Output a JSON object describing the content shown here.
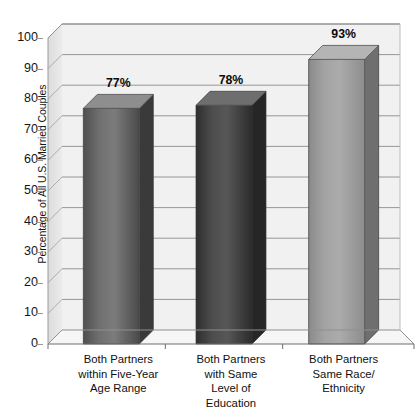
{
  "chart_data": {
    "type": "bar",
    "title": "",
    "subtitle": "",
    "xlabel": "",
    "ylabel": "Percentage of All U.S. Married Couples",
    "ylim": [
      0,
      100
    ],
    "ytick_step": 10,
    "yticks": [
      0,
      10,
      20,
      30,
      40,
      50,
      60,
      70,
      80,
      90,
      100
    ],
    "ytick_labels": [
      "0",
      "10",
      "20",
      "30",
      "40",
      "50",
      "60",
      "70",
      "80",
      "90",
      "100"
    ],
    "grid": true,
    "grid_axis": "y",
    "legend": false,
    "legend_position": "none",
    "style": "3d-bar",
    "categories": [
      "Both Partners within Five-Year Age Range",
      "Both Partners with Same Level of Education",
      "Both Partners Same Race/ Ethnicity"
    ],
    "category_lines": [
      [
        "Both Partners",
        "within Five-Year",
        "Age Range"
      ],
      [
        "Both Partners",
        "with Same",
        "Level of",
        "Education"
      ],
      [
        "Both Partners",
        "Same Race/",
        "Ethnicity"
      ]
    ],
    "values": [
      77,
      78,
      93
    ],
    "value_labels": [
      "77%",
      "78%",
      "93%"
    ],
    "bar_colors": [
      "#6b6b6b",
      "#4a4a4a",
      "#9d9d9d"
    ],
    "bar_top_colors": [
      "#8e8e8e",
      "#6e6e6e",
      "#b4b4b4"
    ],
    "bar_side_colors": [
      "#3a3a3a",
      "#262626",
      "#6f6f6f"
    ]
  },
  "colors": {
    "plot_background": "#f1f1f1",
    "wall_background": "#e4e4e4",
    "floor_background": "#f4f4f4",
    "gridline": "#8c8c8c",
    "axis": "#6e6e6e",
    "text": "#141414"
  }
}
